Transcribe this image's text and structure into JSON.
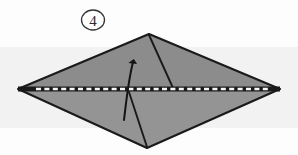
{
  "diagram": {
    "step_label": "4",
    "step_marker_name": "circled-step-number",
    "background": {
      "page_color": "#fdfdfd",
      "scan_band_color": "#f2f2f2",
      "scan_band_top": 47,
      "scan_band_height": 81
    },
    "shape": {
      "name": "kite-diamond-paper",
      "fill_upper": "#8c8c8c",
      "fill_lower": "#949494",
      "outline_color": "#1a1a1a",
      "vertices": {
        "left": [
          18,
          89
        ],
        "top": [
          149,
          34
        ],
        "right": [
          280,
          89
        ],
        "bottom": [
          147,
          148
        ]
      }
    },
    "fold_line": {
      "name": "valley-fold-dashed-line",
      "style": "dashed",
      "dash_color": "#ffffff",
      "base_color": "#1a1a1a",
      "from": [
        18,
        89
      ],
      "to": [
        280,
        89
      ]
    },
    "crease_right": {
      "name": "crease-line-top-right",
      "color": "#1a1a1a",
      "from": [
        149,
        35
      ],
      "to": [
        173,
        88
      ]
    },
    "crease_bottom": {
      "name": "crease-line-bottom",
      "color": "#1a1a1a",
      "from": [
        147,
        147
      ],
      "to": [
        128,
        89
      ]
    },
    "arrow": {
      "name": "fold-up-arrow",
      "color": "#141414",
      "direction": "up",
      "tail": [
        124,
        120
      ],
      "head": [
        133,
        56
      ],
      "head_label": "arrowhead"
    }
  }
}
